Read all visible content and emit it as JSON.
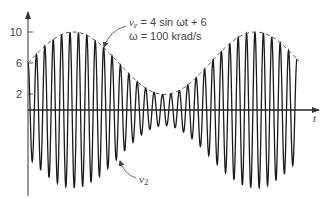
{
  "chart_data": {
    "type": "line",
    "title": "",
    "xlabel": "t",
    "ylabel": "",
    "y_ticks": [
      10,
      6,
      2
    ],
    "ylim": [
      -11,
      13
    ],
    "grid": false,
    "legend": "none",
    "series": [
      {
        "name": "v2",
        "description": "AM carrier signal whose amplitude follows envelope ve",
        "carrier_cycles_visible": 32
      },
      {
        "name": "ve",
        "expression": "4 sin ωt + 6",
        "style": "dashed envelope",
        "max": 10,
        "min": 2,
        "start_value": 6
      }
    ],
    "annotations": [
      {
        "id": "ve_label",
        "text_var": "v",
        "text_sub": "e",
        "text_rest": " = 4 sin ωt + 6"
      },
      {
        "id": "omega_label",
        "text": "ω = 100 krad/s"
      },
      {
        "id": "v2_label",
        "text_var": "v",
        "text_sub": "2"
      }
    ]
  },
  "axis": {
    "x_label": "t",
    "ticks": [
      {
        "label": "10",
        "value": 10
      },
      {
        "label": "6",
        "value": 6
      },
      {
        "label": "2",
        "value": 2
      }
    ]
  },
  "labels": {
    "ve_var": "v",
    "ve_sub": "e",
    "ve_rest": " = 4 sin ωt + 6",
    "omega": "ω = 100 krad/s",
    "v2_var": "v",
    "v2_sub": "2"
  },
  "colors": {
    "axis": "#333333",
    "wave": "#1a1a1a",
    "text": "#444444"
  }
}
